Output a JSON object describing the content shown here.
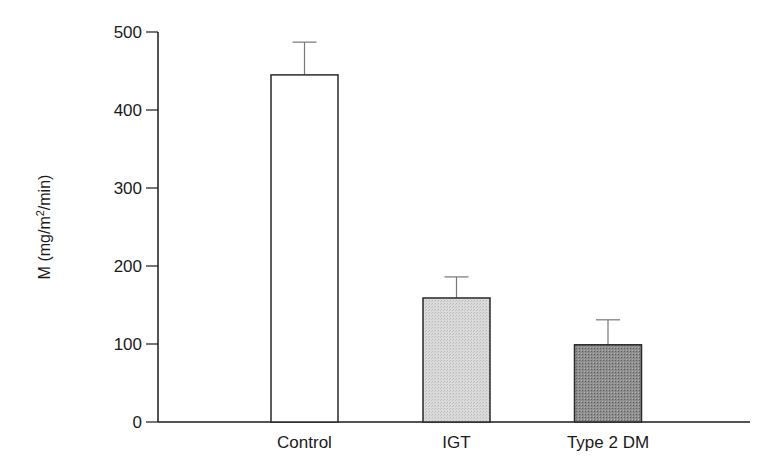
{
  "chart_data": {
    "type": "bar",
    "title": "",
    "xlabel": "",
    "ylabel": "M (mg/m2/min)",
    "ylabel_parts": {
      "prefix": "M (mg/m",
      "sup": "2",
      "suffix": "/min)"
    },
    "categories": [
      "Control",
      "IGT",
      "Type 2 DM"
    ],
    "values": [
      445,
      159,
      99
    ],
    "error_upper": [
      42,
      27,
      32
    ],
    "fills": [
      "#ffffff",
      "#d2d2d2",
      "#8a8a8a"
    ],
    "ylim": [
      0,
      500
    ],
    "yticks": [
      0,
      100,
      200,
      300,
      400,
      500
    ],
    "grid": false,
    "legend": null
  }
}
